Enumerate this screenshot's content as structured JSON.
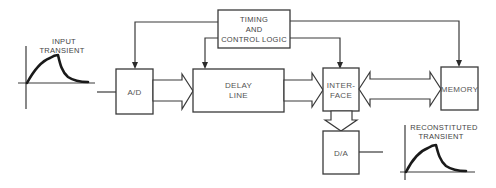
{
  "diagram": {
    "blocks": {
      "timing": {
        "lines": [
          "TIMING",
          "AND",
          "CONTROL LOGIC"
        ]
      },
      "ad": {
        "label": "A/D"
      },
      "delay": {
        "lines": [
          "DELAY",
          "LINE"
        ]
      },
      "interface": {
        "lines": [
          "INTER-",
          "FACE"
        ]
      },
      "memory": {
        "label": "MEMORY"
      },
      "da": {
        "label": "D/A"
      }
    },
    "waveforms": {
      "input": {
        "lines": [
          "INPUT",
          "TRANSIENT"
        ]
      },
      "output": {
        "lines": [
          "RECONSTITUTED",
          "TRANSIENT"
        ]
      }
    },
    "connections": [
      {
        "from": "timing",
        "to": "ad",
        "type": "control"
      },
      {
        "from": "timing",
        "to": "delay",
        "type": "control"
      },
      {
        "from": "timing",
        "to": "interface",
        "type": "control"
      },
      {
        "from": "timing",
        "to": "memory",
        "type": "control"
      },
      {
        "from": "input",
        "to": "ad",
        "type": "signal"
      },
      {
        "from": "ad",
        "to": "delay",
        "type": "bus"
      },
      {
        "from": "delay",
        "to": "interface",
        "type": "bus"
      },
      {
        "from": "interface",
        "to": "memory",
        "type": "bidirectional-bus"
      },
      {
        "from": "interface",
        "to": "da",
        "type": "bus"
      },
      {
        "from": "da",
        "to": "output",
        "type": "signal"
      }
    ]
  }
}
